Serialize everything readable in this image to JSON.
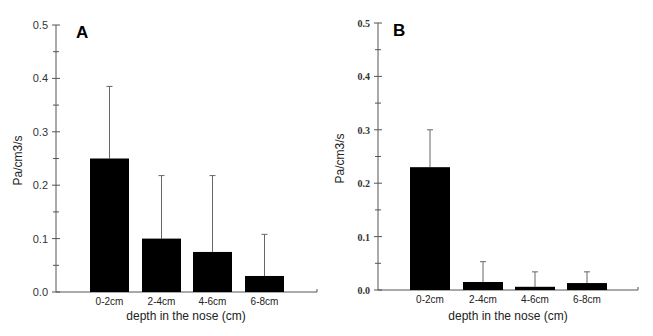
{
  "figure": {
    "panels": [
      {
        "label": "A",
        "ylabel": "Pa/cm3/s",
        "xlabel": "depth in the nose (cm)",
        "yticks": [
          "0.0",
          "0.1",
          "0.2",
          "0.3",
          "0.4",
          "0.5"
        ]
      },
      {
        "label": "B",
        "ylabel": "Pa/cm3/s",
        "xlabel": "depth in the nose (cm)",
        "yticks": [
          "0.0",
          "0.1",
          "0.2",
          "0.3",
          "0.4",
          "0.5"
        ]
      }
    ]
  },
  "chart_data": [
    {
      "type": "bar",
      "title": "A",
      "xlabel": "depth in the nose (cm)",
      "ylabel": "Pa/cm3/s",
      "categories": [
        "0-2cm",
        "2-4cm",
        "4-6cm",
        "6-8cm"
      ],
      "values": [
        0.25,
        0.1,
        0.075,
        0.03
      ],
      "error_upper": [
        0.385,
        0.218,
        0.218,
        0.108
      ],
      "ylim": [
        0,
        0.5
      ],
      "yticks": [
        0.0,
        0.1,
        0.2,
        0.3,
        0.4,
        0.5
      ],
      "grid": false,
      "bar_color": "#000000"
    },
    {
      "type": "bar",
      "title": "B",
      "xlabel": "depth in the nose (cm)",
      "ylabel": "Pa/cm3/s",
      "categories": [
        "0-2cm",
        "2-4cm",
        "4-6cm",
        "6-8cm"
      ],
      "values": [
        0.23,
        0.015,
        0.006,
        0.013
      ],
      "error_upper": [
        0.3,
        0.053,
        0.034,
        0.034
      ],
      "ylim": [
        0,
        0.5
      ],
      "yticks": [
        0.0,
        0.1,
        0.2,
        0.3,
        0.4,
        0.5
      ],
      "grid": false,
      "bar_color": "#000000"
    }
  ]
}
